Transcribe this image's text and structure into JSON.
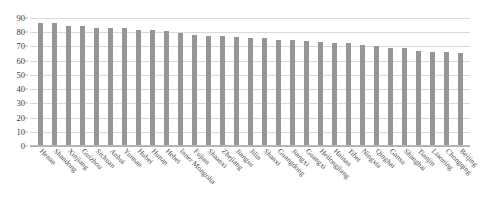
{
  "chart_data": {
    "type": "bar",
    "title": "",
    "xlabel": "",
    "ylabel": "",
    "ylim": [
      0,
      90
    ],
    "yticks": [
      0,
      10,
      20,
      30,
      40,
      50,
      60,
      70,
      80,
      90
    ],
    "grid": true,
    "legend": "none",
    "bar_color": "#969696",
    "gridline_color": "#d9d9d9",
    "categories": [
      "Henan",
      "Shandong",
      "Xinjiang",
      "Guizhou",
      "Sichuan",
      "Anhui",
      "Yunnan",
      "Hubei",
      "Hunan",
      "Hebei",
      "Inner Mongolia",
      "Fujian",
      "Shaanxi",
      "Zhejiang",
      "Jiangsu",
      "Jilin",
      "Shanxi",
      "Guangdong",
      "Jiangxi",
      "Guangxi",
      "Heilongjiang",
      "Hainan",
      "Tibet",
      "Ningxia",
      "Qinghai",
      "Gansu",
      "Shanghai",
      "Tianjin",
      "Liaoning",
      "Chongqing",
      "Beijing"
    ],
    "values": [
      86,
      85.5,
      84,
      83.5,
      82.5,
      82.5,
      82,
      81,
      81,
      80,
      79,
      77.5,
      77,
      76.5,
      76,
      75.5,
      75,
      74,
      73.5,
      73,
      72.5,
      72,
      71.5,
      70.5,
      69.5,
      68.5,
      68,
      66,
      65.5,
      65.5,
      65
    ]
  }
}
